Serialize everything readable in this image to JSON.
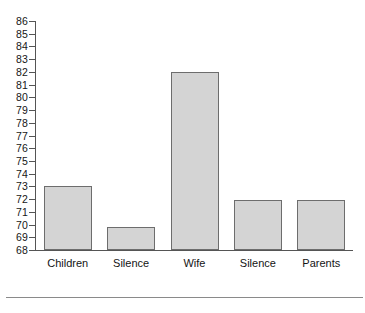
{
  "chart_data": {
    "type": "bar",
    "title": "",
    "subtitle": "",
    "xlabel": "",
    "ylabel": "",
    "categories": [
      "Children",
      "Silence",
      "Wife",
      "Silence",
      "Parents"
    ],
    "values": [
      73,
      69.8,
      82,
      71.9,
      71.9
    ],
    "series": [
      {
        "name": "",
        "values": [
          73,
          69.8,
          82,
          71.9,
          71.9
        ]
      }
    ],
    "ylim": [
      68,
      86
    ],
    "ytick_labels": [
      "86",
      "85",
      "84",
      "83",
      "82",
      "81",
      "80",
      "79",
      "78",
      "77",
      "76",
      "75",
      "74",
      "73",
      "72",
      "71",
      "70",
      "69",
      "68"
    ],
    "ytick_values": [
      86,
      85,
      84,
      83,
      82,
      81,
      80,
      79,
      78,
      77,
      76,
      75,
      74,
      73,
      72,
      71,
      70,
      69,
      68
    ],
    "grid": false,
    "legend": null,
    "legend_position": "none",
    "annotations": [],
    "bar_fill_color": "#d4d4d4",
    "bar_edge_color": "#6d6d6d",
    "axis_color": "#555555",
    "background_color": "#ffffff"
  },
  "figure": {
    "footer_rule_color": "#8a8a8a"
  }
}
